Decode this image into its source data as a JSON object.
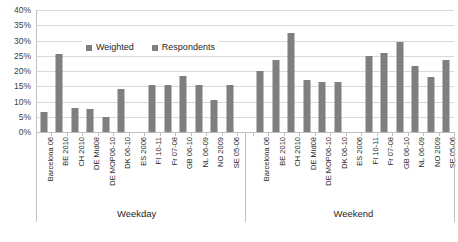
{
  "chart_data": {
    "type": "bar",
    "title": "",
    "xlabel": "",
    "ylabel": "",
    "ylim": [
      0,
      40
    ],
    "ytick_labels": [
      "0%",
      "5%",
      "10%",
      "15%",
      "20%",
      "25%",
      "30%",
      "35%",
      "40%"
    ],
    "ytick_values": [
      0,
      5,
      10,
      15,
      20,
      25,
      30,
      35,
      40
    ],
    "grid": true,
    "legend_position": "top-center",
    "bar_color": "#7f7f7f",
    "grid_color": "#d9d9d9",
    "axis_color": "#bfbfbf",
    "legend": [
      {
        "name": "Weighted",
        "color": "#7f7f7f"
      },
      {
        "name": "Respondents",
        "color": "#7f7f7f"
      }
    ],
    "groups": [
      {
        "name": "Weekday",
        "categories": [
          "Barcelona 06",
          "BE 2010",
          "CH 2010",
          "DE Mid08",
          "DE MOP06-10",
          "DK 06-10",
          "ES 2006",
          "FI 10-11",
          "Fr 07-08",
          "GB 06-10",
          "NL 06-09",
          "NO 2009",
          "SE 05-06"
        ],
        "values": [
          6.5,
          25.5,
          8.0,
          7.5,
          5.0,
          14.0,
          0,
          15.5,
          15.5,
          18.5,
          15.5,
          10.5,
          15.5
        ]
      },
      {
        "name": "Weekend",
        "categories": [
          "Barcelona 06",
          "BE 2010",
          "CH 2010",
          "DE Mid08",
          "DE MOP06-10",
          "DK 06-10",
          "ES 2006",
          "FI 10-11",
          "Fr 07-08",
          "GB 06-10",
          "NL 06-09",
          "NO 2009",
          "SE 05-06"
        ],
        "values": [
          20.0,
          23.5,
          32.5,
          17.0,
          16.5,
          16.5,
          0,
          25.0,
          26.0,
          29.5,
          21.5,
          18.0,
          23.5
        ]
      }
    ]
  },
  "legend": {
    "weighted_label": "Weighted",
    "respondents_label": "Respondents"
  },
  "axis": {
    "group_weekday": "Weekday",
    "group_weekend": "Weekend"
  }
}
